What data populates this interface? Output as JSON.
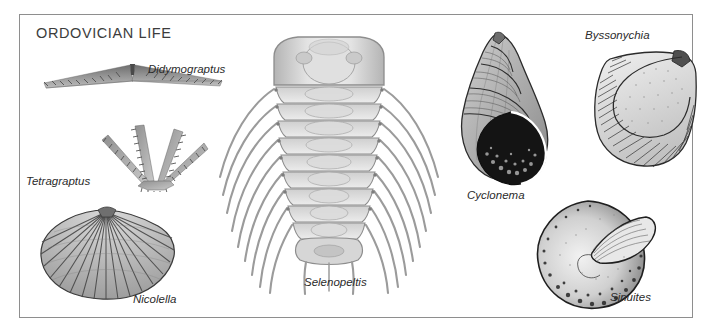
{
  "plate": {
    "title": "ORDOVICIAN LIFE",
    "frame_color": "#8e8e8e",
    "background_color": "#ffffff",
    "ink_color": "#2b2b2b"
  },
  "specimens": [
    {
      "name": "Didymograptus",
      "label": "Didymograptus",
      "group": "graptolite",
      "icon": "didymograptus-fossil",
      "label_x": 128,
      "label_y": 58
    },
    {
      "name": "Tetragraptus",
      "label": "Tetragraptus",
      "group": "graptolite",
      "icon": "tetragraptus-fossil",
      "label_x": 27,
      "label_y": 169
    },
    {
      "name": "Nicolella",
      "label": "Nicolella",
      "group": "brachiopod",
      "icon": "nicolella-fossil",
      "label_x": 133,
      "label_y": 287
    },
    {
      "name": "Selenopeltis",
      "label": "Selenopeltis",
      "group": "trilobite",
      "icon": "selenopeltis-fossil",
      "label_x": 303,
      "label_y": 270
    },
    {
      "name": "Cyclonema",
      "label": "Cyclonema",
      "group": "gastropod",
      "icon": "cyclonema-fossil",
      "label_x": 466,
      "label_y": 183
    },
    {
      "name": "Byssonychia",
      "label": "Byssonychia",
      "group": "bivalve",
      "icon": "byssonychia-fossil",
      "label_x": 584,
      "label_y": 23
    },
    {
      "name": "Sinuites",
      "label": "Sinuites",
      "group": "gastropod",
      "icon": "sinuites-fossil",
      "label_x": 609,
      "label_y": 285
    }
  ]
}
